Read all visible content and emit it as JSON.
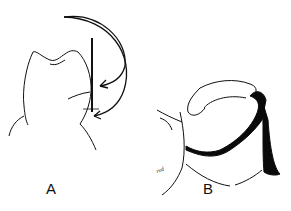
{
  "figure": {
    "panels": [
      {
        "id": "A",
        "label": "A",
        "description": "tooth crown outline with vertical probe inserted along the side, curved arrows indicating insertion path"
      },
      {
        "id": "B",
        "label": "B",
        "description": "tooth with dark band/matrix wrapped around it"
      }
    ],
    "signature": "rvd",
    "colors": {
      "line": "#111111",
      "background": "#ffffff",
      "band": "#0a0a0a"
    }
  }
}
